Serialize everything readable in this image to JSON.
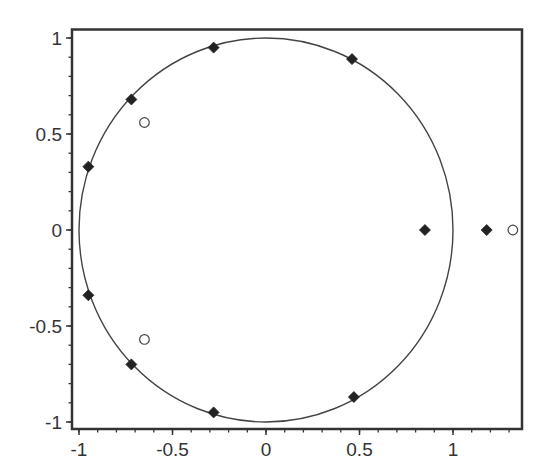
{
  "chart_data": {
    "type": "scatter",
    "title": "",
    "xlabel": "",
    "ylabel": "",
    "xlim": [
      -1.04,
      1.37
    ],
    "ylim": [
      -1.04,
      1.05
    ],
    "grid": false,
    "legend": null,
    "x_ticks": [
      -1,
      -0.5,
      0,
      0.5,
      1
    ],
    "x_tick_labels": [
      "-1",
      "-0.5",
      "0",
      "0.5",
      "1"
    ],
    "y_ticks": [
      1,
      0.5,
      0,
      -0.5,
      -1
    ],
    "y_tick_labels": [
      "1",
      "0.5",
      "0",
      "-0.5",
      "-1"
    ],
    "reference_curve": {
      "name": "unit circle",
      "cx": 0,
      "cy": 0,
      "r": 1,
      "color": "#444444"
    },
    "series": [
      {
        "name": "filled diamonds",
        "marker": "diamond-filled",
        "color": "#222222",
        "points": [
          {
            "x": -0.28,
            "y": 0.95
          },
          {
            "x": 0.46,
            "y": 0.89
          },
          {
            "x": -0.72,
            "y": 0.68
          },
          {
            "x": -0.95,
            "y": 0.33
          },
          {
            "x": -0.95,
            "y": -0.34
          },
          {
            "x": -0.72,
            "y": -0.7
          },
          {
            "x": -0.28,
            "y": -0.95
          },
          {
            "x": 0.47,
            "y": -0.87
          },
          {
            "x": 0.85,
            "y": 0.0
          },
          {
            "x": 1.18,
            "y": 0.0
          }
        ]
      },
      {
        "name": "open circles",
        "marker": "circle-open",
        "color": "#444444",
        "points": [
          {
            "x": -0.65,
            "y": 0.56
          },
          {
            "x": -0.65,
            "y": -0.57
          },
          {
            "x": 1.32,
            "y": 0.0
          }
        ]
      }
    ]
  }
}
